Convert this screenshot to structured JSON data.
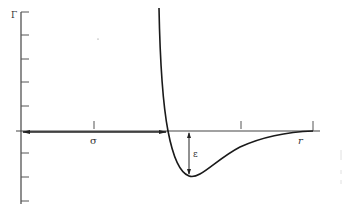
{
  "diagram": {
    "type": "potential-energy-curve",
    "y_axis_label": "Γ",
    "labels": {
      "sigma": "σ",
      "epsilon": "ε",
      "r": "r"
    },
    "colors": {
      "ink": "#1a1a1a",
      "axis": "#444444",
      "background": "#ffffff"
    }
  }
}
